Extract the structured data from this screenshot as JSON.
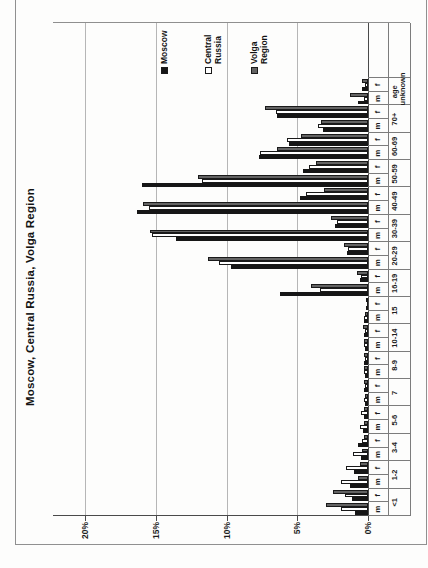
{
  "chart_data": {
    "type": "bar",
    "title": "Moscow, Central Russia, Volga Region",
    "ylabel": "",
    "xlabel": "age",
    "ylim": [
      0,
      20
    ],
    "y_ticks": [
      "0%",
      "5%",
      "10%",
      "15%",
      "20%"
    ],
    "grid": true,
    "legend_position": "right",
    "rotation": "figure rotated 90deg CCW on scanned page",
    "age_groups": [
      "<1",
      "1-2",
      "3-4",
      "5-6",
      "7",
      "8-9",
      "10-14",
      "15",
      "16-19",
      "20-29",
      "30-39",
      "40-49",
      "50-59",
      "60-69",
      "70+",
      "age unknown"
    ],
    "sex_labels": [
      "m",
      "f"
    ],
    "series": [
      {
        "name": "Moscow",
        "color": "#161616",
        "m": [
          0.9,
          1.3,
          0.5,
          0.35,
          0.2,
          0.2,
          0.2,
          0.3,
          6.2,
          9.7,
          13.6,
          16.3,
          16.0,
          7.7,
          3.2,
          0.7
        ],
        "f": [
          1.1,
          1.0,
          0.7,
          0.3,
          0.3,
          0.3,
          0.3,
          0.15,
          0.6,
          1.5,
          2.3,
          4.8,
          4.6,
          5.6,
          6.4,
          0.4
        ]
      },
      {
        "name": "Central Russia",
        "color": "#ffffff",
        "m": [
          1.9,
          1.9,
          1.05,
          0.55,
          0.3,
          0.3,
          0.25,
          0.25,
          3.4,
          10.5,
          15.3,
          15.5,
          11.7,
          7.6,
          3.5,
          0.3
        ],
        "f": [
          1.6,
          1.55,
          0.45,
          0.5,
          0.2,
          0.2,
          0.2,
          0.1,
          0.5,
          1.4,
          2.2,
          4.4,
          4.2,
          5.7,
          6.5,
          0.2
        ]
      },
      {
        "name": "Volga Region",
        "color": "#636363",
        "m": [
          3.0,
          0.7,
          0.4,
          0.3,
          0.2,
          0.25,
          0.3,
          0.2,
          4.0,
          11.3,
          15.4,
          15.9,
          12.0,
          6.4,
          3.3,
          1.3
        ],
        "f": [
          2.5,
          0.6,
          0.3,
          0.3,
          0.3,
          0.25,
          0.35,
          0.15,
          0.8,
          1.7,
          2.6,
          3.1,
          3.7,
          4.7,
          7.3,
          0.4
        ]
      }
    ],
    "legend": [
      {
        "label_lines": [
          "Moscow"
        ],
        "color": "#161616"
      },
      {
        "label_lines": [
          "Central",
          "Russia"
        ],
        "color": "#ffffff"
      },
      {
        "label_lines": [
          "Volga",
          "Region"
        ],
        "color": "#636363"
      }
    ]
  },
  "colors": {
    "bar_outline": "#1a1a1a",
    "gridline": "#b6b6b6",
    "axis": "#4a4a4a",
    "table_border": "#7c7c7c",
    "figure_border": "#909090",
    "background": "#fdfdfc"
  }
}
